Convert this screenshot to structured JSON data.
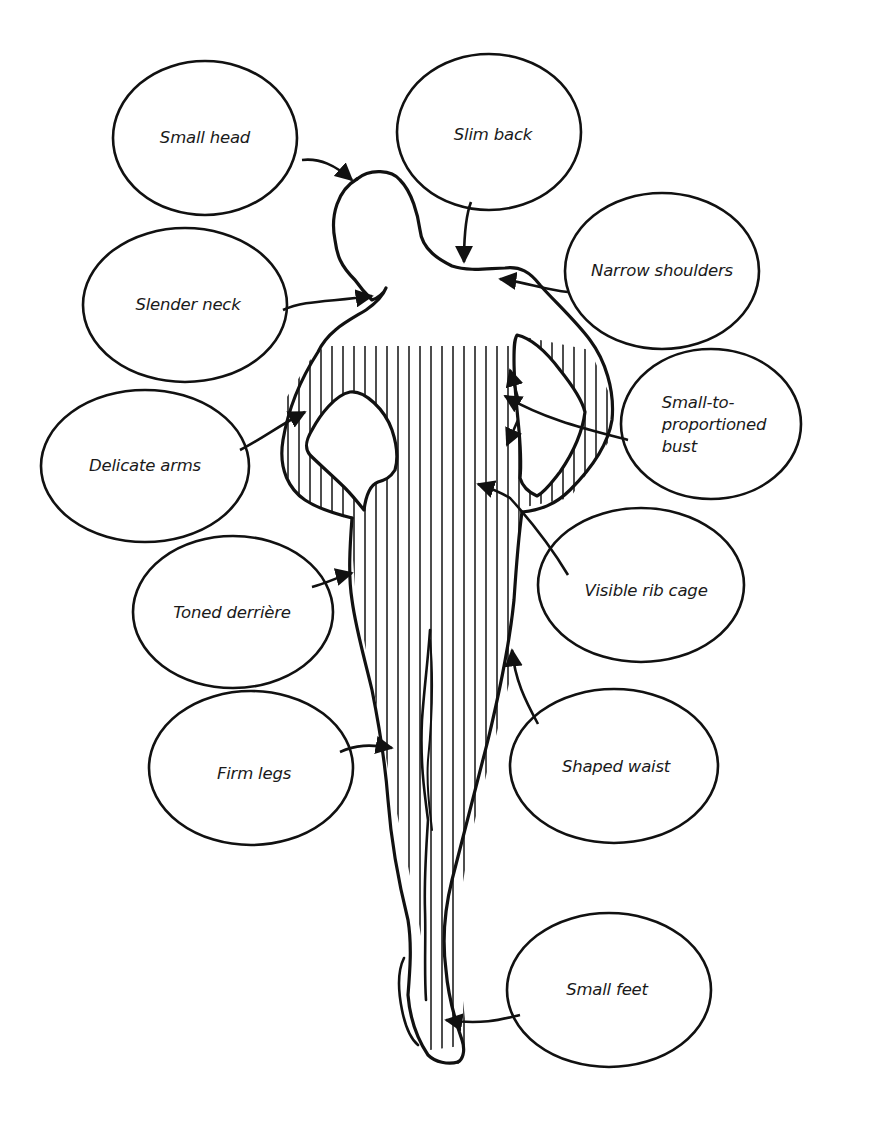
{
  "diagram": {
    "colors": {
      "ink": "#111111",
      "background": "#ffffff"
    },
    "figure": "female-figure-back-view",
    "labels": [
      {
        "id": "small-head",
        "text": "Small head",
        "cx": 205,
        "cy": 138,
        "rx": 92,
        "ry": 77
      },
      {
        "id": "slim-back",
        "text": "Slim back",
        "cx": 489,
        "cy": 132,
        "rx": 92,
        "ry": 78
      },
      {
        "id": "narrow-shoulders",
        "text": "Narrow shoulders",
        "cx": 662,
        "cy": 271,
        "rx": 97,
        "ry": 78
      },
      {
        "id": "slender-neck",
        "text": "Slender neck",
        "cx": 185,
        "cy": 305,
        "rx": 102,
        "ry": 77
      },
      {
        "id": "small-to-proportioned-bust",
        "text": "Small-to-\nproportioned\nbust",
        "cx": 711,
        "cy": 424,
        "rx": 90,
        "ry": 75
      },
      {
        "id": "delicate-arms",
        "text": "Delicate arms",
        "cx": 145,
        "cy": 466,
        "rx": 104,
        "ry": 76
      },
      {
        "id": "visible-rib-cage",
        "text": "Visible rib cage",
        "cx": 641,
        "cy": 585,
        "rx": 103,
        "ry": 77
      },
      {
        "id": "toned-derriere",
        "text": "Toned derrière",
        "cx": 233,
        "cy": 612,
        "rx": 100,
        "ry": 76
      },
      {
        "id": "firm-legs",
        "text": "Firm legs",
        "cx": 251,
        "cy": 768,
        "rx": 102,
        "ry": 77
      },
      {
        "id": "shaped-waist",
        "text": "Shaped waist",
        "cx": 614,
        "cy": 766,
        "rx": 104,
        "ry": 77
      },
      {
        "id": "small-feet",
        "text": "Small feet",
        "cx": 609,
        "cy": 990,
        "rx": 102,
        "ry": 77
      }
    ]
  }
}
